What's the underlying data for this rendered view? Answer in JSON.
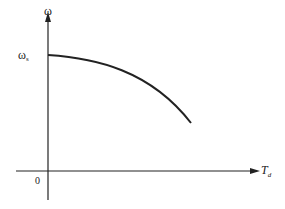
{
  "diagram": {
    "type": "speed-torque characteristic curve",
    "y_axis": {
      "label": "ω"
    },
    "x_axis": {
      "label_main": "T",
      "label_sub": "d"
    },
    "origin_label": "0",
    "y_intercept": {
      "label_main": "ω",
      "label_sub": "s"
    },
    "curve": {
      "description": "concave-down curve decreasing from ω_s at T_d = 0",
      "start": [
        48,
        55
      ],
      "end": [
        191,
        123
      ]
    },
    "colors": {
      "line": "#222222",
      "background": "#ffffff"
    }
  }
}
